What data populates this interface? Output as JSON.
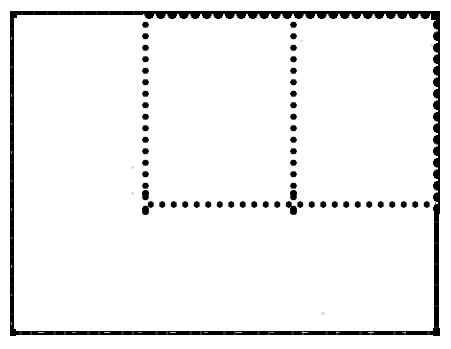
{
  "figure": {
    "background_color": "#ffffff",
    "ink_color": "#000000",
    "width": 451,
    "height": 349,
    "labels": {
      "canvas": "",
      "outer_frame": "",
      "top_border_thin_segment": "",
      "top_border_thick_segment": "",
      "left_border": "",
      "right_border_upper": "",
      "right_border_lower": "",
      "bottom_border": "",
      "dotted_column_left": "",
      "dotted_column_right": "",
      "dotted_row_middle": "",
      "cell_upper_left": "",
      "cell_upper_middle": "",
      "cell_upper_right": "",
      "cell_lower": ""
    }
  },
  "chart_data": {
    "type": "diagram",
    "title": "",
    "xlabel": "",
    "ylabel": "",
    "grid": false,
    "legend": [],
    "annotations": [],
    "strokes": [
      {
        "name": "outer-frame-left",
        "style": "solid",
        "orientation": "vertical",
        "x": 12,
        "y_start": 11,
        "y_end": 336,
        "thickness": 4,
        "color": "#000000"
      },
      {
        "name": "outer-frame-top-thin",
        "style": "solid",
        "orientation": "horizontal",
        "y": 13,
        "x_start": 10,
        "x_end": 147,
        "thickness": 4,
        "color": "#000000"
      },
      {
        "name": "outer-frame-top-thick-scalloped",
        "style": "solid-scalloped",
        "orientation": "horizontal",
        "y": 15,
        "x_start": 143,
        "x_end": 440,
        "thickness": 9,
        "color": "#000000"
      },
      {
        "name": "outer-frame-right-thick-scalloped",
        "style": "solid-scalloped",
        "orientation": "vertical",
        "x": 435,
        "y_start": 11,
        "y_end": 214,
        "thickness": 9,
        "color": "#000000"
      },
      {
        "name": "outer-frame-right-thin",
        "style": "solid",
        "orientation": "vertical",
        "x": 436,
        "y_start": 212,
        "y_end": 336,
        "thickness": 5,
        "color": "#000000"
      },
      {
        "name": "outer-frame-bottom",
        "style": "solid-broken",
        "orientation": "horizontal",
        "y": 333,
        "x_start": 10,
        "x_end": 439,
        "thickness": 4,
        "color": "#000000"
      },
      {
        "name": "divider-dotted-vertical-left",
        "style": "dotted",
        "orientation": "vertical",
        "x": 145,
        "y_start": 19,
        "y_end": 215,
        "dot_diameter": 7,
        "dot_pitch": 11.5,
        "dot_count": 17,
        "color": "#000000"
      },
      {
        "name": "divider-dotted-vertical-right",
        "style": "dotted",
        "orientation": "vertical",
        "x": 293,
        "y_start": 19,
        "y_end": 215,
        "dot_diameter": 7,
        "dot_pitch": 11.5,
        "dot_count": 17,
        "color": "#000000"
      },
      {
        "name": "divider-dotted-horizontal",
        "style": "dotted",
        "orientation": "horizontal",
        "y": 205,
        "x_start": 145,
        "x_end": 436,
        "dot_diameter": 7,
        "dot_pitch": 11.5,
        "dot_count": 26,
        "color": "#000000"
      }
    ],
    "regions": [
      {
        "name": "cell-upper-left",
        "x": 14,
        "y": 15,
        "width": 128,
        "height": 190,
        "fill": "#ffffff",
        "label": ""
      },
      {
        "name": "cell-upper-middle",
        "x": 148,
        "y": 20,
        "width": 142,
        "height": 185,
        "fill": "#ffffff",
        "label": ""
      },
      {
        "name": "cell-upper-right",
        "x": 297,
        "y": 20,
        "width": 134,
        "height": 185,
        "fill": "#ffffff",
        "label": ""
      },
      {
        "name": "cell-lower",
        "x": 14,
        "y": 209,
        "width": 420,
        "height": 122,
        "fill": "#ffffff",
        "label": ""
      }
    ]
  }
}
